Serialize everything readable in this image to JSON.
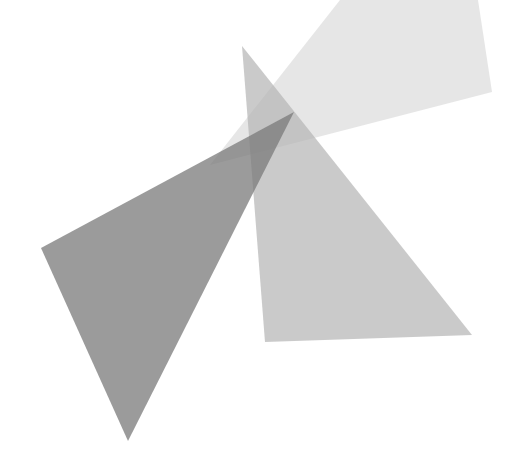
{
  "canvas": {
    "width": 522,
    "height": 465,
    "background": "#ffffff"
  },
  "shapes": [
    {
      "name": "faint-quad",
      "points": "210,165 340,0 478,0 492,92",
      "fill": "#c8c8c8",
      "opacity": 0.45
    },
    {
      "name": "medium-triangle",
      "points": "242,46 265,342 472,335",
      "fill": "#b4b4b4",
      "opacity": 0.7
    },
    {
      "name": "dark-triangle",
      "points": "41,248 294,112 128,441",
      "fill": "#7a7a7a",
      "opacity": 0.75
    }
  ]
}
